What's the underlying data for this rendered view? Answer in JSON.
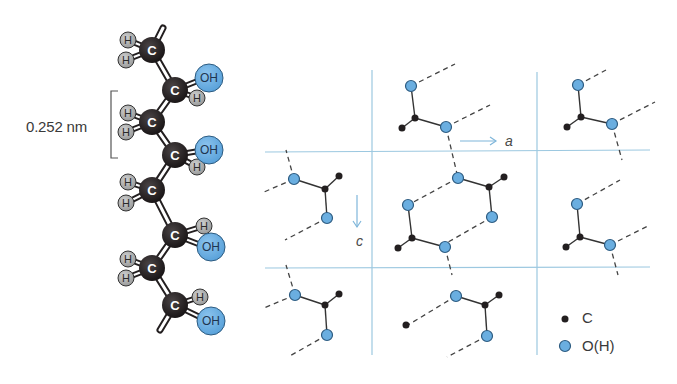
{
  "figure": {
    "chain_label": "0.252 nm",
    "atom_labels": {
      "carbon": "C",
      "hydroxyl": "OH",
      "hydrogen": "H"
    },
    "axes": {
      "a": "a",
      "c": "c"
    },
    "legend": [
      {
        "symbol": "black-dot",
        "label": "C"
      },
      {
        "symbol": "blue-circle",
        "label": "O(H)"
      }
    ],
    "colors": {
      "carbon": "#231f20",
      "oxygen": "#6aaee0",
      "hydrogen": "#a9aaaa",
      "grid_line": "#9cc8e0",
      "dash": "#444444"
    }
  }
}
